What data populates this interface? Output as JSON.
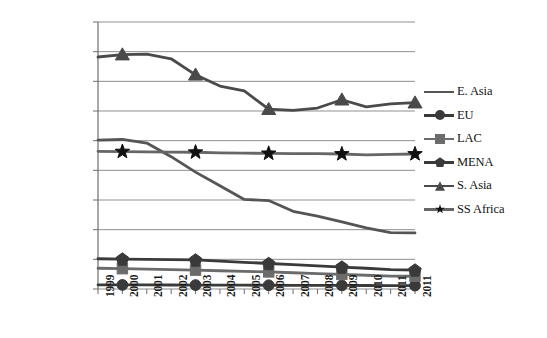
{
  "chart_data": {
    "type": "line",
    "title": "",
    "xlabel": "",
    "ylabel": "",
    "grid": true,
    "legend_position": "right",
    "ylim": [
      0,
      45000000
    ],
    "yticks": [
      45000000,
      40000000,
      35000000,
      30000000,
      25000000,
      20000000,
      15000000,
      10000000,
      5000000,
      0
    ],
    "ytick_labels": [
      "45000000",
      "40000000",
      "35000000",
      "30000000",
      "25000000",
      "20000000",
      "15000000",
      "10000000",
      "5000000",
      "0"
    ],
    "categories": [
      "1999",
      "2000",
      "2001",
      "2002",
      "2003",
      "2004",
      "2005",
      "2006",
      "2007",
      "2008",
      "2009",
      "2010",
      "2011",
      "2011"
    ],
    "marker_every": 3,
    "marker_offset": 1,
    "series": [
      {
        "name": "E. Asia",
        "marker": "none",
        "color": "#555555",
        "values": [
          25100000,
          25200000,
          24600000,
          22300000,
          19700000,
          17400000,
          15100000,
          14900000,
          13100000,
          12300000,
          11300000,
          10300000,
          9500000,
          9450000
        ]
      },
      {
        "name": "EU",
        "marker": "circle",
        "color": "#3a3a3a",
        "values": [
          700000,
          690000,
          680000,
          670000,
          660000,
          650000,
          640000,
          630000,
          620000,
          610000,
          600000,
          590000,
          580000,
          570000
        ]
      },
      {
        "name": "LAC",
        "marker": "square",
        "color": "#6b6b6b",
        "values": [
          3500000,
          3420000,
          3340000,
          3260000,
          3180000,
          3080000,
          2980000,
          2880000,
          2740000,
          2600000,
          2460000,
          2320000,
          2180000,
          2150000
        ]
      },
      {
        "name": "MENA",
        "marker": "diamond",
        "color": "#3a3a3a",
        "values": [
          5100000,
          5050000,
          5000000,
          4950000,
          4900000,
          4700000,
          4500000,
          4300000,
          4100000,
          3900000,
          3700000,
          3500000,
          3250000,
          3200000
        ]
      },
      {
        "name": "S. Asia",
        "marker": "triangle",
        "color": "#4a4a4a",
        "values": [
          39100000,
          39500000,
          39600000,
          38800000,
          36100000,
          34200000,
          33400000,
          30300000,
          30100000,
          30500000,
          31900000,
          30700000,
          31200000,
          31400000
        ]
      },
      {
        "name": "SS Africa",
        "marker": "star",
        "color": "#666666",
        "values": [
          23200000,
          23150000,
          23100000,
          23080000,
          23050000,
          22950000,
          22900000,
          22850000,
          22800000,
          22800000,
          22750000,
          22600000,
          22700000,
          22750000
        ]
      }
    ]
  },
  "legend": {
    "items": [
      {
        "label": "E. Asia",
        "marker": "none"
      },
      {
        "label": "EU",
        "marker": "circle"
      },
      {
        "label": "LAC",
        "marker": "square"
      },
      {
        "label": "MENA",
        "marker": "diamond"
      },
      {
        "label": "S. Asia",
        "marker": "triangle"
      },
      {
        "label": "SS Africa",
        "marker": "star"
      }
    ]
  },
  "axes": {
    "y_axis_name": "y-axis",
    "x_axis_name": "x-axis"
  }
}
